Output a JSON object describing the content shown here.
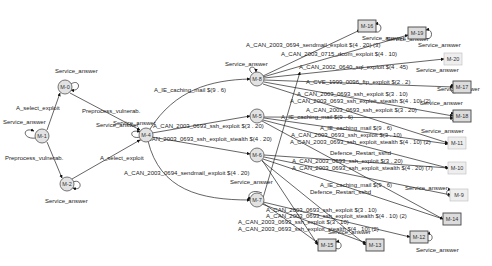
{
  "diagram": {
    "type": "attack-graph",
    "nodes": [
      {
        "id": "M-0",
        "shape": "circle",
        "x": 65,
        "y": 87
      },
      {
        "id": "M-1",
        "shape": "circle",
        "x": 42,
        "y": 136
      },
      {
        "id": "M-2",
        "shape": "circle",
        "x": 67,
        "y": 184
      },
      {
        "id": "M-4",
        "shape": "circle",
        "x": 146,
        "y": 135
      },
      {
        "id": "M-5",
        "shape": "circle",
        "x": 257,
        "y": 116
      },
      {
        "id": "M-6",
        "shape": "circle",
        "x": 257,
        "y": 155
      },
      {
        "id": "M-7",
        "shape": "circle",
        "x": 257,
        "y": 200
      },
      {
        "id": "M-8",
        "shape": "circle",
        "x": 257,
        "y": 79
      },
      {
        "id": "M-9",
        "shape": "rect",
        "x": 459,
        "y": 195
      },
      {
        "id": "M-10",
        "shape": "rect",
        "x": 457,
        "y": 168
      },
      {
        "id": "M-11",
        "shape": "rect",
        "x": 457,
        "y": 143
      },
      {
        "id": "M-12",
        "shape": "rect",
        "x": 419,
        "y": 237
      },
      {
        "id": "M-13",
        "shape": "rect",
        "x": 375,
        "y": 245
      },
      {
        "id": "M-14",
        "shape": "rect",
        "x": 452,
        "y": 219
      },
      {
        "id": "M-15",
        "shape": "rect",
        "x": 327,
        "y": 245
      },
      {
        "id": "M-16",
        "shape": "rect",
        "x": 367,
        "y": 26
      },
      {
        "id": "M-17",
        "shape": "rect",
        "x": 462,
        "y": 87
      },
      {
        "id": "M-18",
        "shape": "rect",
        "x": 462,
        "y": 116
      },
      {
        "id": "M-19",
        "shape": "rect",
        "x": 417,
        "y": 33
      },
      {
        "id": "M-20",
        "shape": "rect",
        "x": 453,
        "y": 59
      }
    ],
    "edge_labels": [
      {
        "text": "Service_answer",
        "x": 55,
        "y": 73
      },
      {
        "text": "A_select_exploit",
        "x": 16,
        "y": 110
      },
      {
        "text": "Service_answer",
        "x": 3,
        "y": 124
      },
      {
        "text": "Preprocess_vulnerab.",
        "x": 82,
        "y": 113
      },
      {
        "text": "Service_answer",
        "x": 96,
        "y": 127
      },
      {
        "text": "Preprocess_vulnerab.",
        "x": 5,
        "y": 160
      },
      {
        "text": "A_select_exploit",
        "x": 100,
        "y": 160
      },
      {
        "text": "Service_answer",
        "x": 45,
        "y": 203
      },
      {
        "text": "A_IE_caching_mail $(9 . 6)",
        "x": 154,
        "y": 92
      },
      {
        "text": "Service_answer",
        "x": 113,
        "y": 125
      },
      {
        "text": "A_CAN_2003_0693_ssh_exploit $(3 . 20)",
        "x": 153,
        "y": 128
      },
      {
        "text": "A_CAN_2003_0693_ssh_exploit_stealth $(4 . 20)",
        "x": 140,
        "y": 141
      },
      {
        "text": "A_CAN_2003_0694_sendmail_exploit $(4 . 20)",
        "x": 124,
        "y": 175
      },
      {
        "text": "Service_answer",
        "x": 225,
        "y": 66
      },
      {
        "text": "A_CAN_2003_0694_sendmail_exploit $(4 . 20) (3)",
        "x": 246,
        "y": 47
      },
      {
        "text": "A_CAN_2003_0715_dcom_exploit $(4 . 10)",
        "x": 281,
        "y": 56
      },
      {
        "text": "A_CAN_2002_0640_sql_exploit $(4 . 45)",
        "x": 299,
        "y": 69
      },
      {
        "text": "A_CVE_1999_0096_ftp_exploit $(2 . 2)",
        "x": 306,
        "y": 84
      },
      {
        "text": "A_CAN_2003_0693_ssh_exploit $(3 . 10)",
        "x": 297,
        "y": 96
      },
      {
        "text": "A_CAN_2003_0693_ssh_exploit_stealth $(4 . 10) (2)",
        "x": 290,
        "y": 103
      },
      {
        "text": "A_CAN_2003_0693_ssh_exploit $(3 . 20)",
        "x": 306,
        "y": 112
      },
      {
        "text": "A_IE_caching_mail $(9 . 6)",
        "x": 281,
        "y": 119
      },
      {
        "text": "A_IE_caching_mail $(9 . 6)",
        "x": 320,
        "y": 130
      },
      {
        "text": "A_CAN_2003_0693_ssh_exploit $(3 . 10)",
        "x": 291,
        "y": 137
      },
      {
        "text": "A_CAN_2003_0693_ssh_exploit_stealth $(4 . 10) (2)",
        "x": 290,
        "y": 144
      },
      {
        "text": "Defence_Restart_sshd",
        "x": 330,
        "y": 155
      },
      {
        "text": "A_CAN_2003_0693_ssh_exploit $(3 . 20)",
        "x": 292,
        "y": 163
      },
      {
        "text": "A_CAN_2003_0693_ssh_exploit_stealth $(4 . 20) (7)",
        "x": 292,
        "y": 170
      },
      {
        "text": "A_IE_caching_mail $(9 . 6)",
        "x": 320,
        "y": 187
      },
      {
        "text": "Defence_Restart_sshd",
        "x": 310,
        "y": 194
      },
      {
        "text": "Service_answer",
        "x": 230,
        "y": 184
      },
      {
        "text": "A_CAN_2003_0693_ssh_exploit $(3 . 10)",
        "x": 266,
        "y": 212
      },
      {
        "text": "A_CAN_2003_0693_ssh_exploit_stealth $(4 . 10) (2)",
        "x": 266,
        "y": 218
      },
      {
        "text": "A_CAN_2003_0693_ssh_exploit $(3 . 10)",
        "x": 238,
        "y": 224
      },
      {
        "text": "A_CAN_2003_0693_ssh_exploit_stealth $(4 . 10) (2)",
        "x": 238,
        "y": 231
      },
      {
        "text": "Service_answer",
        "x": 328,
        "y": 234
      },
      {
        "text": "Service_answer",
        "x": 416,
        "y": 252
      },
      {
        "text": "Service_answer",
        "x": 405,
        "y": 190
      },
      {
        "text": "Service_answer",
        "x": 420,
        "y": 105
      },
      {
        "text": "Service_answer",
        "x": 421,
        "y": 133
      },
      {
        "text": "Service_answer",
        "x": 437,
        "y": 91
      },
      {
        "text": "Service_answer",
        "x": 416,
        "y": 72
      },
      {
        "text": "Service_answer",
        "x": 386,
        "y": 41
      },
      {
        "text": "Service_answer",
        "x": 418,
        "y": 47
      },
      {
        "text": "Service_answer",
        "x": 362,
        "y": 40
      }
    ]
  }
}
